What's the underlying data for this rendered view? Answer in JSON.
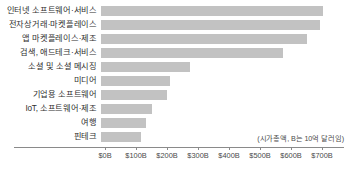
{
  "chart_data": {
    "type": "bar",
    "orientation": "horizontal",
    "title": "",
    "subtitle": "",
    "xlabel": "",
    "ylabel": "",
    "categories": [
      "인터넷 소프트웨어·서비스",
      "전자상거래·마켓플레이스",
      "앱 마켓플레이스·제조",
      "검색, 애드테크·서비스",
      "소셜 및 소셜 메시징",
      "미디어",
      "기업용 소프트웨어",
      "IoT, 소프트웨어·제조",
      "여행",
      "핀테크"
    ],
    "values": [
      703,
      694,
      652,
      574,
      274,
      210,
      200,
      152,
      132,
      116
    ],
    "value_unit": "B",
    "xlim": [
      0,
      760
    ],
    "xticks": [
      0,
      100,
      200,
      300,
      400,
      500,
      600,
      700
    ],
    "xtick_labels": [
      "$0B",
      "$100B",
      "$200B",
      "$300B",
      "$400B",
      "$500B",
      "$600B",
      "$700B"
    ],
    "grid": false,
    "legend": false,
    "annotation": "(시가총액, B는 10억 달러임)",
    "bar_color": "#c2c2c2",
    "axis_color": "#8a8a8a",
    "text_color": "#2f2f2f"
  }
}
